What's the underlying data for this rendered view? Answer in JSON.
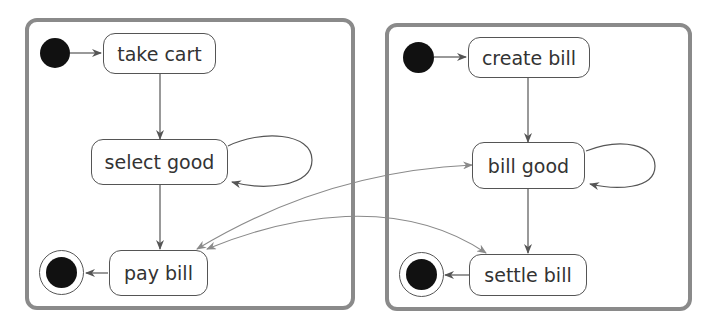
{
  "diagram": {
    "type": "uml-state-machine",
    "regions": [
      {
        "id": "customer",
        "states": [
          {
            "id": "take_cart",
            "label": "take cart"
          },
          {
            "id": "select_good",
            "label": "select good"
          },
          {
            "id": "pay_bill",
            "label": "pay bill"
          }
        ],
        "transitions": [
          {
            "from": "initial",
            "to": "take cart"
          },
          {
            "from": "take cart",
            "to": "select good"
          },
          {
            "from": "select good",
            "to": "select good",
            "self_loop": true
          },
          {
            "from": "select good",
            "to": "pay bill"
          },
          {
            "from": "pay bill",
            "to": "final"
          }
        ]
      },
      {
        "id": "cashier",
        "states": [
          {
            "id": "create_bill",
            "label": "create bill"
          },
          {
            "id": "bill_good",
            "label": "bill good"
          },
          {
            "id": "settle_bill",
            "label": "settle bill"
          }
        ],
        "transitions": [
          {
            "from": "initial",
            "to": "create bill"
          },
          {
            "from": "create bill",
            "to": "bill good"
          },
          {
            "from": "bill good",
            "to": "bill good",
            "self_loop": true
          },
          {
            "from": "bill good",
            "to": "settle bill"
          },
          {
            "from": "settle bill",
            "to": "final"
          }
        ]
      }
    ],
    "cross_links": [
      {
        "between": [
          "pay bill",
          "bill good"
        ],
        "bidirectional": true
      },
      {
        "between": [
          "pay bill",
          "settle bill"
        ],
        "bidirectional": true
      }
    ],
    "colors": {
      "frame": "#8a8a8a",
      "edge": "#555555",
      "cross_edge": "#8a8a8a",
      "node_fill": "#111111"
    }
  }
}
